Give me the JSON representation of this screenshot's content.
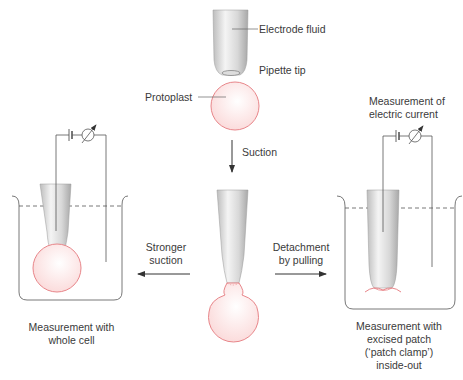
{
  "labels": {
    "electrode_fluid": "Electrode fluid",
    "pipette_tip": "Pipette tip",
    "protoplast": "Protoplast",
    "suction": "Suction",
    "stronger_suction_1": "Stronger",
    "stronger_suction_2": "suction",
    "detachment_1": "Detachment",
    "detachment_2": "by pulling",
    "measurement_current_1": "Measurement of",
    "measurement_current_2": "electric current",
    "whole_cell_1": "Measurement with",
    "whole_cell_2": "whole cell",
    "excised_1": "Measurement with",
    "excised_2": "excised patch",
    "excised_3": "(‘patch clamp’)",
    "excised_4": "inside-out"
  },
  "colors": {
    "cell_outline": "#e8868a",
    "cell_fill": "#fdeeee",
    "line": "#555555",
    "pipette_light": "#f2f2f2",
    "pipette_dark": "#b8b8b8"
  }
}
